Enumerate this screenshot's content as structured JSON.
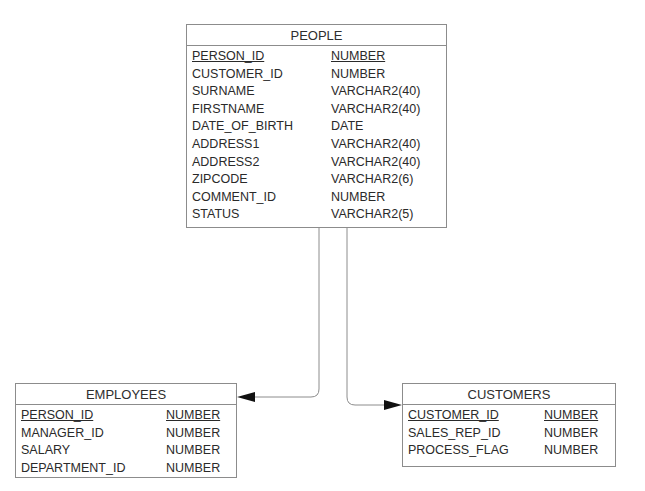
{
  "diagram": {
    "type": "entity-relationship",
    "line_color": "#8c8c8c",
    "arrow_color": "#111111",
    "entities": [
      {
        "name": "PEOPLE",
        "columns": [
          {
            "name": "PERSON_ID",
            "type": "NUMBER",
            "primary_key": true
          },
          {
            "name": "CUSTOMER_ID",
            "type": "NUMBER",
            "primary_key": false
          },
          {
            "name": "SURNAME",
            "type": "VARCHAR2(40)",
            "primary_key": false
          },
          {
            "name": "FIRSTNAME",
            "type": "VARCHAR2(40)",
            "primary_key": false
          },
          {
            "name": "DATE_OF_BIRTH",
            "type": "DATE",
            "primary_key": false
          },
          {
            "name": "ADDRESS1",
            "type": "VARCHAR2(40)",
            "primary_key": false
          },
          {
            "name": "ADDRESS2",
            "type": "VARCHAR2(40)",
            "primary_key": false
          },
          {
            "name": "ZIPCODE",
            "type": "VARCHAR2(6)",
            "primary_key": false
          },
          {
            "name": "COMMENT_ID",
            "type": "NUMBER",
            "primary_key": false
          },
          {
            "name": "STATUS",
            "type": "VARCHAR2(5)",
            "primary_key": false
          }
        ]
      },
      {
        "name": "EMPLOYEES",
        "columns": [
          {
            "name": "PERSON_ID",
            "type": "NUMBER",
            "primary_key": true
          },
          {
            "name": "MANAGER_ID",
            "type": "NUMBER",
            "primary_key": false
          },
          {
            "name": "SALARY",
            "type": "NUMBER",
            "primary_key": false
          },
          {
            "name": "DEPARTMENT_ID",
            "type": "NUMBER",
            "primary_key": false
          }
        ]
      },
      {
        "name": "CUSTOMERS",
        "columns": [
          {
            "name": "CUSTOMER_ID",
            "type": "NUMBER",
            "primary_key": true
          },
          {
            "name": "SALES_REP_ID",
            "type": "NUMBER",
            "primary_key": false
          },
          {
            "name": "PROCESS_FLAG",
            "type": "NUMBER",
            "primary_key": false
          }
        ]
      }
    ],
    "relationships": [
      {
        "from": "PEOPLE",
        "to": "EMPLOYEES"
      },
      {
        "from": "PEOPLE",
        "to": "CUSTOMERS"
      }
    ]
  }
}
